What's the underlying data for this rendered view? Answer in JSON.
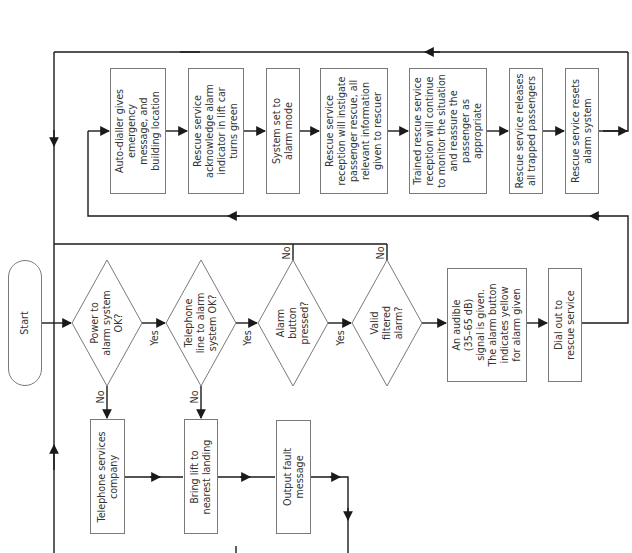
{
  "diagram": {
    "type": "flowchart",
    "orientation": "rotated-90-ccw",
    "start": {
      "label": "Start"
    },
    "decisions": [
      {
        "id": "d1",
        "label": "Power to\nalarm system\nOK?",
        "yes": "Yes",
        "no": "No"
      },
      {
        "id": "d2",
        "label": "Telephone\nline to alarm\nsystem OK?",
        "yes": "Yes",
        "no": "No"
      },
      {
        "id": "d3",
        "label": "Alarm\nbutton\npressed?",
        "yes": "Yes",
        "no": "No"
      },
      {
        "id": "d4",
        "label": "Valid\nfiltered\nalarm?",
        "no": "No"
      }
    ],
    "fault_path": [
      {
        "id": "f1",
        "label": "Telephone services\ncompany"
      },
      {
        "id": "f2",
        "label": "Bring lift to\nnearest landing"
      },
      {
        "id": "f3",
        "label": "Output fault\nmessage"
      }
    ],
    "alarm_path": [
      {
        "id": "a1",
        "label": "An audible\n(35–65 dB)\nsignal is given.\nThe alarm button\nindicates yellow\nfor alarm given"
      },
      {
        "id": "a2",
        "label": "Dial out to\nrescue service"
      }
    ],
    "rescue_path": [
      {
        "id": "r1",
        "label": "Auto-dialler gives\nemergency\nmessage, and\nbuilding location"
      },
      {
        "id": "r2",
        "label": "Rescue service\nacknowledge alarm\nindicator in lift car\nturns green"
      },
      {
        "id": "r3",
        "label": "System set to\nalarm mode"
      },
      {
        "id": "r4",
        "label": "Rescue service\nreception will instigate\npassenger rescue, all\nrelevant information\ngiven to rescuer"
      },
      {
        "id": "r5",
        "label": "Trained rescue service\nreception will continue\nto monitor the situation\nand reassure the\npassenger as\nappropriate"
      },
      {
        "id": "r6",
        "label": "Rescue service releases\nall trapped passengers"
      },
      {
        "id": "r7",
        "label": "Rescue service resets\nalarm system"
      }
    ]
  },
  "colors": {
    "line": "#1a1a1a",
    "border": "#7a7a7a",
    "text": "#333333",
    "background": "#ffffff"
  }
}
